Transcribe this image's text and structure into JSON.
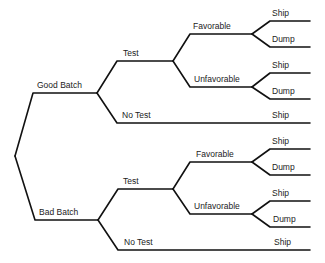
{
  "diagram": {
    "type": "decision-tree",
    "root": {
      "branches": [
        {
          "label": "Good Batch",
          "branches": [
            {
              "label": "Test",
              "branches": [
                {
                  "label": "Favorable",
                  "branches": [
                    {
                      "label": "Ship"
                    },
                    {
                      "label": "Dump"
                    }
                  ]
                },
                {
                  "label": "Unfavorable",
                  "branches": [
                    {
                      "label": "Ship"
                    },
                    {
                      "label": "Dump"
                    }
                  ]
                }
              ]
            },
            {
              "label": "No Test",
              "branches": [
                {
                  "label": "Ship"
                }
              ]
            }
          ]
        },
        {
          "label": "Bad Batch",
          "branches": [
            {
              "label": "Test",
              "branches": [
                {
                  "label": "Favorable",
                  "branches": [
                    {
                      "label": "Ship"
                    },
                    {
                      "label": "Dump"
                    }
                  ]
                },
                {
                  "label": "Unfavorable",
                  "branches": [
                    {
                      "label": "Ship"
                    },
                    {
                      "label": "Dump"
                    }
                  ]
                }
              ]
            },
            {
              "label": "No Test",
              "branches": [
                {
                  "label": "Ship"
                }
              ]
            }
          ]
        }
      ]
    }
  },
  "line_color": "#111111",
  "text_color": "#222222"
}
